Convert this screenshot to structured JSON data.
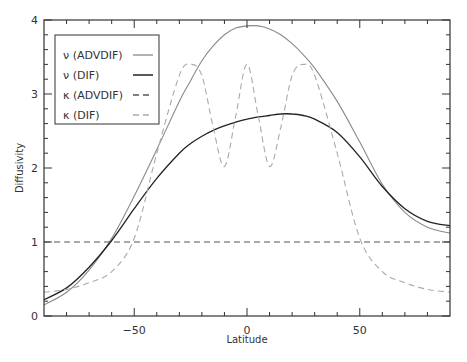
{
  "chart_data": {
    "type": "line",
    "title": "",
    "xlabel": "Latitude",
    "ylabel": "Diffusivity",
    "xlim": [
      -90,
      90
    ],
    "ylim": [
      0,
      4
    ],
    "x_ticks": [
      -50,
      0,
      50
    ],
    "x_tick_labels": [
      "−50",
      "0",
      "50"
    ],
    "y_ticks": [
      0,
      1,
      2,
      3,
      4
    ],
    "y_tick_labels": [
      "0",
      "1",
      "2",
      "3",
      "4"
    ],
    "grid": false,
    "legend_position": "upper-left",
    "x": [
      -90,
      -80,
      -70,
      -60,
      -50,
      -40,
      -30,
      -25,
      -20,
      -15,
      -10,
      -5,
      0,
      5,
      10,
      15,
      20,
      25,
      30,
      40,
      50,
      60,
      70,
      80,
      90
    ],
    "series": [
      {
        "name": "ν (ADVDIF)",
        "style": "solid",
        "color": "#8a8a8a",
        "width": 1.1,
        "values": [
          0.15,
          0.32,
          0.62,
          1.05,
          1.62,
          2.25,
          2.9,
          3.18,
          3.45,
          3.65,
          3.8,
          3.89,
          3.92,
          3.92,
          3.88,
          3.8,
          3.68,
          3.53,
          3.35,
          2.9,
          2.35,
          1.78,
          1.4,
          1.2,
          1.12
        ]
      },
      {
        "name": "ν (DIF)",
        "style": "solid",
        "color": "#222222",
        "width": 1.3,
        "values": [
          0.22,
          0.38,
          0.66,
          1.02,
          1.45,
          1.86,
          2.2,
          2.33,
          2.43,
          2.51,
          2.57,
          2.62,
          2.66,
          2.69,
          2.71,
          2.73,
          2.73,
          2.71,
          2.66,
          2.48,
          2.15,
          1.75,
          1.45,
          1.28,
          1.22
        ]
      },
      {
        "name": "κ (ADVDIF)",
        "style": "dashed",
        "color": "#555555",
        "width": 1.1,
        "values": [
          1,
          1,
          1,
          1,
          1,
          1,
          1,
          1,
          1,
          1,
          1,
          1,
          1,
          1,
          1,
          1,
          1,
          1,
          1,
          1,
          1,
          1,
          1,
          1,
          1
        ]
      },
      {
        "name": "κ (DIF)",
        "style": "dashed",
        "color": "#aaaaaa",
        "width": 1.1,
        "values": [
          0.32,
          0.36,
          0.45,
          0.6,
          1.05,
          2.2,
          3.25,
          3.4,
          3.25,
          2.55,
          2.02,
          2.7,
          3.4,
          2.7,
          2.02,
          2.55,
          3.25,
          3.4,
          3.25,
          2.2,
          1.05,
          0.6,
          0.45,
          0.36,
          0.32
        ]
      }
    ]
  },
  "legend": {
    "items": [
      {
        "label": "ν (ADVDIF)"
      },
      {
        "label": "ν (DIF)"
      },
      {
        "label": "κ (ADVDIF)"
      },
      {
        "label": "κ (DIF)"
      }
    ]
  },
  "axes": {
    "xlabel": "Latitude",
    "ylabel": "Diffusivity"
  }
}
